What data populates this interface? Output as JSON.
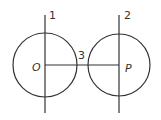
{
  "diagram": {
    "labels": {
      "line1": "1",
      "line2": "2",
      "segment": "3",
      "center_left": "O",
      "center_right": "P"
    },
    "circles": [
      {
        "name": "circle-O",
        "cx": 45,
        "cy": 65,
        "r": 32
      },
      {
        "name": "circle-P",
        "cx": 119,
        "cy": 65,
        "r": 31
      }
    ],
    "lines": [
      {
        "name": "line-1",
        "x1": 45,
        "y1": 15,
        "x2": 45,
        "y2": 113
      },
      {
        "name": "line-2",
        "x1": 119,
        "y1": 15,
        "x2": 119,
        "y2": 113
      },
      {
        "name": "segment-OP",
        "x1": 45,
        "y1": 65,
        "x2": 119,
        "y2": 65
      }
    ],
    "colors": {
      "stroke": "#333333",
      "background": "#ffffff"
    }
  }
}
